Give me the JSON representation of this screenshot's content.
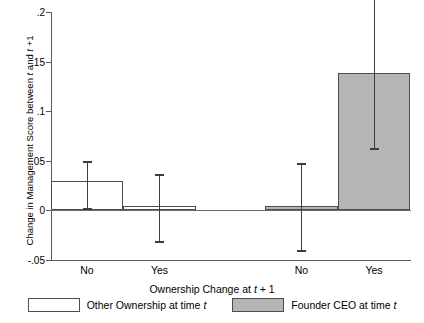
{
  "chart_data": {
    "type": "bar",
    "title": "",
    "xlabel_parts": {
      "pre": "Ownership Change at ",
      "italic": "t",
      "post": " + 1"
    },
    "ylabel_parts": {
      "pre": "Change in Management Score between ",
      "italic1": "t",
      "mid": " and ",
      "italic2": "t",
      "post": " +1"
    },
    "categories": [
      "No",
      "Yes",
      "No",
      "Yes"
    ],
    "groups": [
      {
        "name": "Other Ownership at time t",
        "color": "#ffffff",
        "categories": [
          "No",
          "Yes"
        ]
      },
      {
        "name": "Founder CEO at time t",
        "color": "#b5b5b5",
        "categories": [
          "No",
          "Yes"
        ]
      }
    ],
    "values": [
      0.03,
      0.004,
      0.004,
      0.139
    ],
    "ci_low": [
      0.0005,
      -0.033,
      -0.042,
      0.061
    ],
    "ci_high": [
      0.05,
      0.037,
      0.048,
      0.22
    ],
    "yticks": [
      0.2,
      0.15,
      0.1,
      0.05,
      0,
      -0.05
    ],
    "ytick_labels": [
      ".2",
      ".15",
      ".1",
      ".05",
      "0",
      "-.05"
    ],
    "ylim": [
      -0.05,
      0.2
    ],
    "grid": false,
    "legend_position": "bottom"
  },
  "axis": {
    "ytick_labels": [
      ".2",
      ".15",
      ".1",
      ".05",
      "0",
      "-.05"
    ],
    "xtick_labels": [
      "No",
      "Yes",
      "No",
      "Yes"
    ]
  },
  "legend": {
    "items": [
      {
        "label_pre": "Other Ownership at time ",
        "label_italic": "t",
        "swatch": "white"
      },
      {
        "label_pre": "Founder CEO at time ",
        "label_italic": "t",
        "swatch": "gray"
      }
    ]
  },
  "labels": {
    "y_axis_title_pre": "Change in Management Score between ",
    "y_axis_title_i1": "t",
    "y_axis_title_mid": " and ",
    "y_axis_title_i2": "t",
    "y_axis_title_post": " +1",
    "x_axis_title_pre": "Ownership Change at ",
    "x_axis_title_i": "t",
    "x_axis_title_post": " + 1"
  }
}
